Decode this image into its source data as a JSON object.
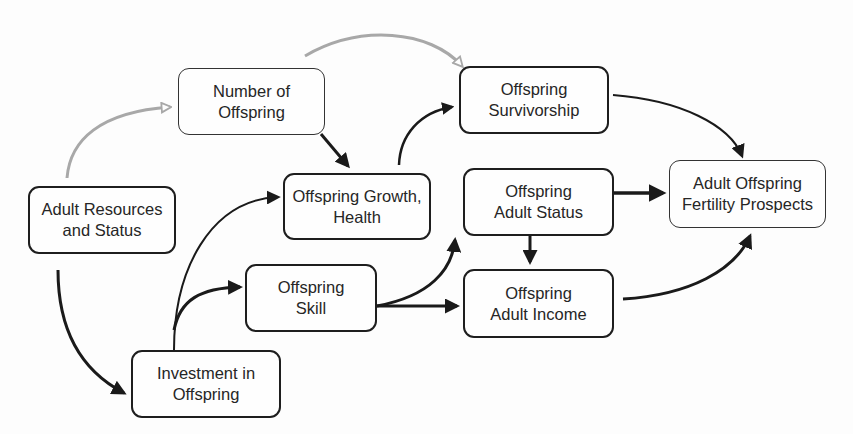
{
  "diagram": {
    "type": "causal-flow-diagram",
    "colors": {
      "primary_arrow": "#1a1a1a",
      "secondary_arrow": "#a8a8a8",
      "box_border": "#1e1e1e",
      "text": "#262626"
    },
    "nodes": {
      "number_of_offspring": {
        "line1": "Number of",
        "line2": "Offspring"
      },
      "adult_resources": {
        "line1": "Adult Resources",
        "line2": "and Status"
      },
      "growth_health": {
        "line1": "Offspring Growth,",
        "line2": "Health"
      },
      "survivorship": {
        "line1": "Offspring",
        "line2": "Survivorship"
      },
      "adult_status": {
        "line1": "Offspring",
        "line2": "Adult Status"
      },
      "fertility_prospects": {
        "line1": "Adult Offspring",
        "line2": "Fertility Prospects"
      },
      "skill": {
        "line1": "Offspring",
        "line2": "Skill"
      },
      "adult_income": {
        "line1": "Offspring",
        "line2": "Adult Income"
      },
      "investment": {
        "line1": "Investment in",
        "line2": "Offspring"
      }
    },
    "edges": [
      {
        "from": "Adult Resources and Status",
        "to": "Number of Offspring",
        "style": "gray-hollow"
      },
      {
        "from": "Number of Offspring",
        "to": "Offspring Survivorship",
        "style": "gray-hollow"
      },
      {
        "from": "Number of Offspring",
        "to": "Offspring Growth, Health",
        "style": "black"
      },
      {
        "from": "Adult Resources and Status",
        "to": "Investment in Offspring",
        "style": "black"
      },
      {
        "from": "Investment in Offspring",
        "to": "Offspring Growth, Health",
        "style": "black"
      },
      {
        "from": "Investment in Offspring",
        "to": "Offspring Skill",
        "style": "black"
      },
      {
        "from": "Offspring Growth, Health",
        "to": "Offspring Survivorship",
        "style": "black"
      },
      {
        "from": "Offspring Skill",
        "to": "Offspring Adult Status",
        "style": "black"
      },
      {
        "from": "Offspring Skill",
        "to": "Offspring Adult Income",
        "style": "black"
      },
      {
        "from": "Offspring Adult Status",
        "to": "Offspring Adult Income",
        "style": "black"
      },
      {
        "from": "Offspring Adult Status",
        "to": "Adult Offspring Fertility Prospects",
        "style": "black"
      },
      {
        "from": "Offspring Survivorship",
        "to": "Adult Offspring Fertility Prospects",
        "style": "black"
      },
      {
        "from": "Offspring Adult Income",
        "to": "Adult Offspring Fertility Prospects",
        "style": "black"
      }
    ]
  }
}
